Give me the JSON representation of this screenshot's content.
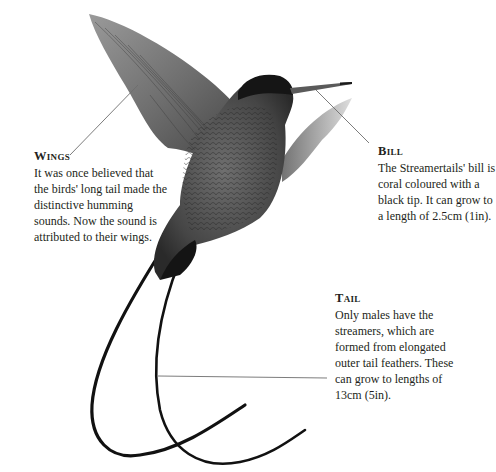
{
  "figure": {
    "colors": {
      "ink": "#231f20",
      "leader_line": "#6d6d6d",
      "background": "#ffffff"
    }
  },
  "annotations": {
    "wings": {
      "heading": "Wings",
      "body": "It was once believed that the birds' long tail made the distinctive humming sounds. Now the sound is attributed to their wings."
    },
    "bill": {
      "heading": "Bill",
      "body": "The Streamertails' bill is coral coloured with a black tip. It can grow to a length of 2.5cm (1in)."
    },
    "tail": {
      "heading": "Tail",
      "body": "Only males have the streamers, which are formed from elongated outer tail feathers. These can grow to lengths of 13cm (5in)."
    }
  }
}
